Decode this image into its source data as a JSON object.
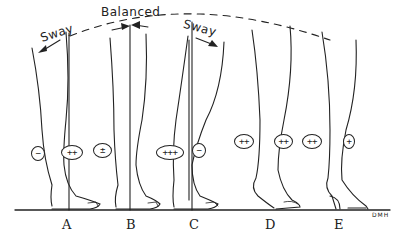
{
  "labels": {
    "sway_left": "Sway",
    "balanced": "Balanced",
    "sway_right": "Sway",
    "signature": "DMH"
  },
  "figures": [
    {
      "letter": "A",
      "badges": [
        {
          "text": "−"
        },
        {
          "text": "++"
        }
      ]
    },
    {
      "letter": "B",
      "badges": [
        {
          "text": "±"
        }
      ]
    },
    {
      "letter": "C",
      "badges": [
        {
          "text": "+++"
        },
        {
          "text": "−"
        }
      ]
    },
    {
      "letter": "D",
      "badges": [
        {
          "text": "++"
        },
        {
          "text": "++"
        }
      ]
    },
    {
      "letter": "E",
      "badges": [
        {
          "text": "++"
        },
        {
          "text": "+"
        }
      ]
    }
  ],
  "colors": {
    "ink": "#222222",
    "background": "#ffffff"
  }
}
